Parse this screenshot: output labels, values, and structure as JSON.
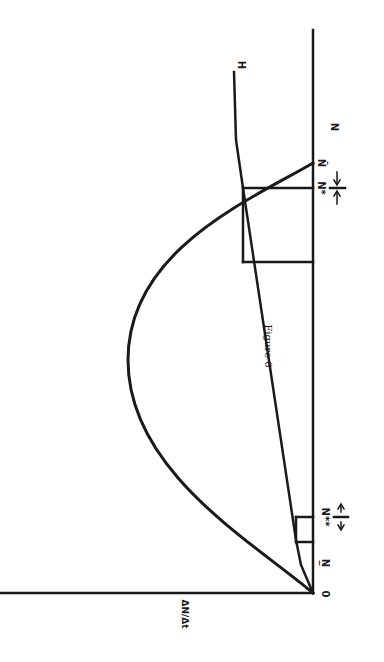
{
  "figure": {
    "caption": "Figure 6",
    "orientation": "rotated 90° clockwise on page",
    "axes": {
      "x_label": "N",
      "y_label": "ΔN/Δt",
      "origin_label": "0"
    },
    "labels": {
      "n_lower": "N̲",
      "n_double_star": "N**",
      "n_star": "N*",
      "n_bar": "N̄",
      "harvest": "H"
    },
    "curves": [
      {
        "name": "growth-curve",
        "shape": "parabola (logistic growth) from 0 to N̄"
      },
      {
        "name": "harvest-line",
        "shape": "rising line from origin, flattening near H"
      }
    ]
  },
  "colors": {
    "ink": "#1a1a1a",
    "background": "#ffffff"
  }
}
